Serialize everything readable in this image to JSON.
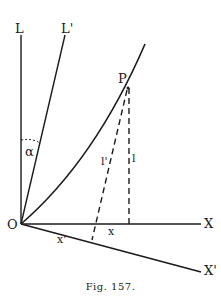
{
  "figure": {
    "caption": "Fig. 157.",
    "labels": {
      "L": "L",
      "L_prime": "L'",
      "P": "P",
      "alpha": "α",
      "O": "O",
      "X": "X",
      "X_prime": "X'",
      "x": "x",
      "x_prime": "x'",
      "l": "l",
      "l_prime": "l'"
    }
  }
}
